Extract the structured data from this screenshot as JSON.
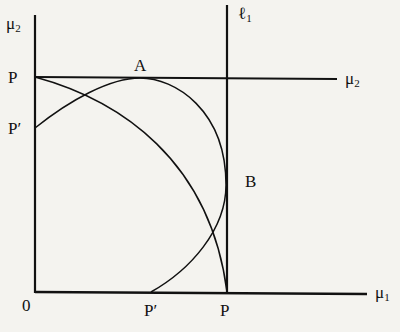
{
  "diagram": {
    "labels": {
      "y_axis": "μ",
      "y_axis_sub": "2",
      "x_axis": "μ",
      "x_axis_sub": "1",
      "origin": "0",
      "P_top": "P",
      "P_prime_left": "P′",
      "A": "A",
      "B": "B",
      "line_l1": "ℓ",
      "line_l1_sub": "1",
      "line_mu2": "μ",
      "line_mu2_sub": "2",
      "P_prime_bottom": "P′",
      "P_bottom": "P"
    },
    "colors": {
      "background": "#f4f3ef",
      "ink": "#111111"
    }
  }
}
